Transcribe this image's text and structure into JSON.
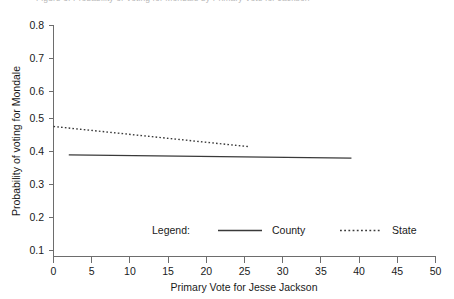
{
  "caption": {
    "text": "Figure 3: Probability of Voting for Mondale by Primary Vote for Jackson"
  },
  "chart_data": {
    "type": "line",
    "title": "",
    "xlabel": "Primary Vote for Jesse Jackson",
    "ylabel": "Probability of voting for Mondale",
    "xlim": [
      0,
      50
    ],
    "ylim": [
      0.1,
      0.8
    ],
    "xticks": [
      "0",
      "5",
      "10",
      "15",
      "20",
      "25",
      "30",
      "35",
      "40",
      "45",
      "50"
    ],
    "yticks": [
      "0.1",
      "0.2",
      "0.3",
      "0.4",
      "0.5",
      "0.6",
      "0.7",
      "0.8"
    ],
    "grid": false,
    "legend_position": "inside-bottom",
    "legend_title": "Legend:",
    "series": [
      {
        "name": "County",
        "style": "solid",
        "color": "#3a3a3a",
        "x": [
          2,
          39
        ],
        "values": [
          0.408,
          0.398
        ]
      },
      {
        "name": "State",
        "style": "dotted",
        "color": "#3a3a3a",
        "x": [
          0,
          25.5
        ],
        "values": [
          0.494,
          0.433
        ]
      }
    ]
  }
}
